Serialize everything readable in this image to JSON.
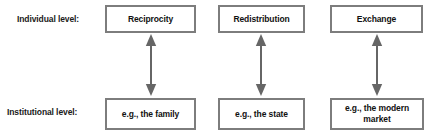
{
  "diagram": {
    "colors": {
      "box_border": "#7d7d7d",
      "box_fill": "#ffffff",
      "text": "#111111",
      "arrow": "#666666",
      "background": "#ffffff"
    },
    "rows": [
      {
        "id": "individual",
        "label": "Individual level:"
      },
      {
        "id": "institutional",
        "label": "Institutional level:"
      }
    ],
    "columns": [
      {
        "id": "reciprocity",
        "individual": "Reciprocity",
        "institutional": "e.g., the family",
        "connector": "double-headed-vertical-arrow"
      },
      {
        "id": "redistribution",
        "individual": "Redistribution",
        "institutional": "e.g., the state",
        "connector": "double-headed-vertical-arrow"
      },
      {
        "id": "exchange",
        "individual": "Exchange",
        "institutional": "e.g., the modern\nmarket",
        "connector": "double-headed-vertical-arrow"
      }
    ]
  }
}
